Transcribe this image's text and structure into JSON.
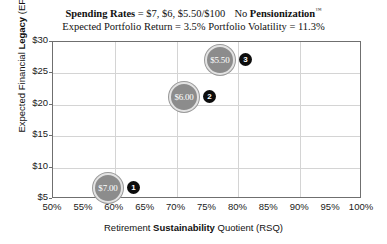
{
  "titles": {
    "line1_prefix_bold": "Spending Rates",
    "line1_mid": " = $7, $6, $5.50/$100",
    "line1_no": "No ",
    "line1_bold2": "Pensionization",
    "line1_tm": "™",
    "line2": "Expected Portfolio Return = 3.5%   Portfolio Volatility = 11.3%"
  },
  "axes": {
    "y_label_pre": "Expected Financial ",
    "y_label_bold": "Legacy",
    "y_label_post": " (EFL)",
    "x_label_pre": "Retirement ",
    "x_label_bold": "Sustainability",
    "x_label_post": " Quotient (RSQ)"
  },
  "chart_data": {
    "type": "scatter",
    "subtitle": "Expected Portfolio Return = 3.5%   Portfolio Volatility = 11.3%",
    "xlabel": "Retirement Sustainability Quotient (RSQ)",
    "ylabel": "Expected Financial Legacy (EFL)",
    "xlim": [
      50,
      100
    ],
    "ylim": [
      5,
      30
    ],
    "x_ticks": [
      "50%",
      "55%",
      "60%",
      "65%",
      "70%",
      "75%",
      "80%",
      "85%",
      "90%",
      "95%",
      "100%"
    ],
    "x_tick_values": [
      50,
      55,
      60,
      65,
      70,
      75,
      80,
      85,
      90,
      95,
      100
    ],
    "y_ticks": [
      "$5",
      "$10",
      "$15",
      "$20",
      "$25",
      "$30"
    ],
    "y_tick_values": [
      5,
      10,
      15,
      20,
      25,
      30
    ],
    "grid": true,
    "grid_x_values": [
      60,
      70,
      80,
      90
    ],
    "grid_y_values": [
      10,
      15,
      20,
      25
    ],
    "legend": "none",
    "bubble_color": "#8c8c8c",
    "badge_color": "#0d0d0d",
    "points": [
      {
        "label": "$7.00",
        "badge": "1",
        "rsq": 58.9,
        "efl": 6.8,
        "spending_rate": 7.0
      },
      {
        "label": "$6.00",
        "badge": "2",
        "rsq": 71.2,
        "efl": 21.3,
        "spending_rate": 6.0
      },
      {
        "label": "$5.50",
        "badge": "3",
        "rsq": 77.0,
        "efl": 27.2,
        "spending_rate": 5.5
      }
    ]
  }
}
